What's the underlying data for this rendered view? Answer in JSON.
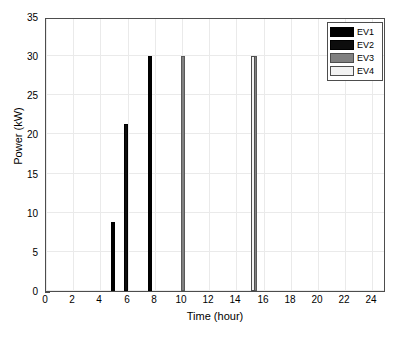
{
  "chart_data": {
    "type": "bar",
    "title": "",
    "xlabel": "Time (hour)",
    "ylabel": "Power (kW)",
    "xlim": [
      0,
      25
    ],
    "ylim": [
      0,
      35
    ],
    "grid": true,
    "legend_position": "top-right",
    "xticks": [
      0,
      2,
      4,
      6,
      8,
      10,
      12,
      14,
      16,
      18,
      20,
      22,
      24
    ],
    "yticks": [
      0,
      5,
      10,
      15,
      20,
      25,
      30,
      35
    ],
    "xtick_labels": [
      "0",
      "2",
      "4",
      "6",
      "8",
      "10",
      "12",
      "14",
      "16",
      "18",
      "20",
      "22",
      "24"
    ],
    "ytick_labels": [
      "0",
      "5",
      "10",
      "15",
      "20",
      "25",
      "30",
      "35"
    ],
    "series": [
      {
        "name": "EV1",
        "color": "#000000",
        "edge": "#000000",
        "points": [
          {
            "x": 4.95,
            "y": 8.8
          },
          {
            "x": 7.65,
            "y": 30.0
          }
        ]
      },
      {
        "name": "EV2",
        "color": "#0d0d0d",
        "edge": "#000000",
        "points": [
          {
            "x": 5.9,
            "y": 21.3
          }
        ]
      },
      {
        "name": "EV3",
        "color": "#808080",
        "edge": "#595959",
        "points": [
          {
            "x": 10.05,
            "y": 30.0
          },
          {
            "x": 15.4,
            "y": 30.0
          }
        ]
      },
      {
        "name": "EV4",
        "color": "#f2f2f2",
        "edge": "#4d4d4d",
        "points": [
          {
            "x": 15.25,
            "y": 30.0
          }
        ]
      }
    ]
  },
  "legend": {
    "items": [
      {
        "label": "EV1",
        "color": "#000000",
        "edge": "#000000"
      },
      {
        "label": "EV2",
        "color": "#0d0d0d",
        "edge": "#000000"
      },
      {
        "label": "EV3",
        "color": "#808080",
        "edge": "#4d4d4d"
      },
      {
        "label": "EV4",
        "color": "#f2f2f2",
        "edge": "#4d4d4d"
      }
    ]
  }
}
